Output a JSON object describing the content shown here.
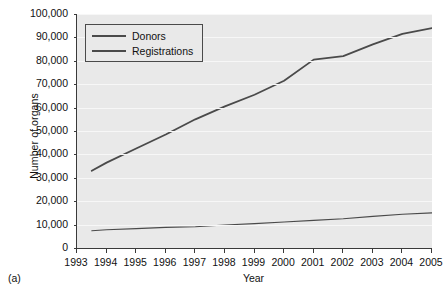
{
  "caption": "(a)",
  "chart_data": {
    "type": "line",
    "title": "",
    "xlabel": "Year",
    "ylabel": "Number of organs",
    "xlim": [
      1993,
      2005
    ],
    "ylim": [
      0,
      100000
    ],
    "grid": true,
    "legend_position": "top-left",
    "x": [
      1993.5,
      1994,
      1995,
      1996,
      1997,
      1998,
      1999,
      2000,
      2001,
      2002,
      2003,
      2004,
      2005
    ],
    "x_tick_labels": [
      "1993",
      "1994",
      "1995",
      "1996",
      "1997",
      "1998",
      "1999",
      "2000",
      "2001",
      "2002",
      "2003",
      "2004",
      "2005"
    ],
    "y_tick_labels": [
      "0",
      "10,000",
      "20,000",
      "30,000",
      "40,000",
      "50,000",
      "60,000",
      "70,000",
      "80,000",
      "90,000",
      "100,000"
    ],
    "y_tick_values": [
      0,
      10000,
      20000,
      30000,
      40000,
      50000,
      60000,
      70000,
      80000,
      90000,
      100000
    ],
    "series": [
      {
        "name": "Donors",
        "color": "#4a4a4a",
        "line_width": 1.1,
        "values": [
          7400,
          7800,
          8300,
          8800,
          9100,
          9800,
          10400,
          11100,
          11800,
          12500,
          13500,
          14400,
          15000
        ]
      },
      {
        "name": "Registrations",
        "color": "#4a4a4a",
        "line_width": 1.8,
        "values": [
          33000,
          36500,
          42500,
          48500,
          55000,
          60500,
          65500,
          71500,
          80500,
          82000,
          87000,
          91500,
          94000
        ]
      }
    ]
  }
}
